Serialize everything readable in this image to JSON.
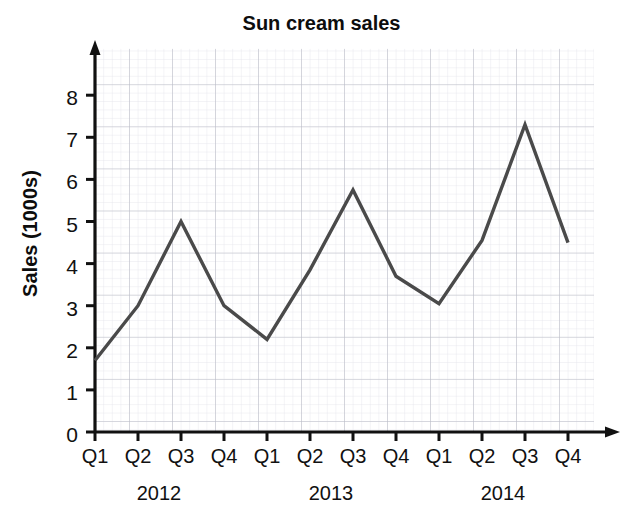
{
  "chart_data": {
    "type": "line",
    "title": "Sun cream sales",
    "xlabel": "",
    "ylabel": "Sales (1000s)",
    "ylim": [
      0,
      8.6
    ],
    "yticks": [
      0,
      1,
      2,
      3,
      4,
      5,
      6,
      7,
      8
    ],
    "ytick_labels": [
      "0",
      "1",
      "2",
      "3",
      "4",
      "5",
      "6",
      "7",
      "8"
    ],
    "categories": [
      "Q1",
      "Q2",
      "Q3",
      "Q4",
      "Q1",
      "Q2",
      "Q3",
      "Q4",
      "Q1",
      "Q2",
      "Q3",
      "Q4"
    ],
    "group_labels": [
      "2012",
      "2013",
      "2014"
    ],
    "values": [
      1.7,
      3.0,
      5.0,
      3.0,
      2.2,
      3.85,
      5.75,
      3.7,
      3.05,
      4.55,
      7.3,
      4.5
    ],
    "series": [
      {
        "name": "Sales",
        "values": [
          1.7,
          3.0,
          5.0,
          3.0,
          2.2,
          3.85,
          5.75,
          3.7,
          3.05,
          4.55,
          7.3,
          4.5
        ]
      }
    ],
    "grid": true,
    "grid_minor": true,
    "legend": false,
    "line_color": "#4a4a4a",
    "grid_major_color": "#b9bcc6",
    "grid_minor_color": "#dfe1e8",
    "axis_color": "#111111"
  },
  "axis": {
    "y_title": "Sales (1000s)",
    "y_labels": [
      "0",
      "1",
      "2",
      "3",
      "4",
      "5",
      "6",
      "7",
      "8"
    ],
    "x_labels": [
      "Q1",
      "Q2",
      "Q3",
      "Q4",
      "Q1",
      "Q2",
      "Q3",
      "Q4",
      "Q1",
      "Q2",
      "Q3",
      "Q4"
    ],
    "x_group_labels": [
      "2012",
      "2013",
      "2014"
    ]
  },
  "header": {
    "title": "Sun cream sales"
  }
}
